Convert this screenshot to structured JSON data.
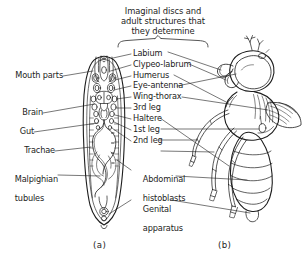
{
  "figure": {
    "title": "Imaginal discs and\nadult structures that\nthey determine",
    "background_color": "#ffffff",
    "ink_color": "#1d1d1d"
  },
  "panels": [
    {
      "id": "a",
      "caption": "(a)",
      "subject": "larva-internal-anatomy"
    },
    {
      "id": "b",
      "caption": "(b)",
      "subject": "adult-fly"
    }
  ],
  "left_labels": [
    {
      "text": "Mouth parts",
      "target": "larva-head"
    },
    {
      "text": "Brain",
      "target": "larva-brain"
    },
    {
      "text": "Gut",
      "target": "larva-gut"
    },
    {
      "text": "Trachae",
      "target": "larva-trachea"
    },
    {
      "text": "Malpighian",
      "text2": "tubules",
      "target": "larva-malpighian-tubules"
    }
  ],
  "center_labels": [
    {
      "text": "Labium"
    },
    {
      "text": "Clypeo-labrum"
    },
    {
      "text": "Humerus"
    },
    {
      "text": "Eye-antenna"
    },
    {
      "text": "Wing-thorax"
    },
    {
      "text": "3rd leg"
    },
    {
      "text": "Haltere"
    },
    {
      "text": "1st leg"
    },
    {
      "text": "2nd leg"
    },
    {
      "text": "Abdominal",
      "text2": "histoblasts"
    },
    {
      "text": "Genital",
      "text2": "apparatus"
    }
  ]
}
